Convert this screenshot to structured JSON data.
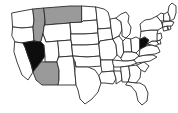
{
  "figure": {
    "kind": "choropleth-map",
    "region": "United States",
    "background_color": "#ffffff",
    "border_color": "#2b2b2b",
    "width": 178,
    "height": 113
  },
  "legend_colors": {
    "highlight_dark": "#0d0d0d",
    "highlight_mid": "#9a9a9a",
    "unhighlighted": "#ffffff"
  },
  "states": [
    {
      "id": "WA",
      "name": "Washington",
      "fill": "none"
    },
    {
      "id": "OR",
      "name": "Oregon",
      "fill": "none"
    },
    {
      "id": "CA",
      "name": "California",
      "fill": "none"
    },
    {
      "id": "ID",
      "name": "Idaho",
      "fill": "gray"
    },
    {
      "id": "NV",
      "name": "Nevada",
      "fill": "black"
    },
    {
      "id": "MT",
      "name": "Montana",
      "fill": "gray"
    },
    {
      "id": "WY",
      "name": "Wyoming",
      "fill": "none"
    },
    {
      "id": "UT",
      "name": "Utah",
      "fill": "none"
    },
    {
      "id": "AZ",
      "name": "Arizona",
      "fill": "gray"
    },
    {
      "id": "CO",
      "name": "Colorado",
      "fill": "none"
    },
    {
      "id": "NM",
      "name": "New Mexico",
      "fill": "none"
    },
    {
      "id": "ND",
      "name": "North Dakota",
      "fill": "none"
    },
    {
      "id": "SD",
      "name": "South Dakota",
      "fill": "none"
    },
    {
      "id": "NE",
      "name": "Nebraska",
      "fill": "none"
    },
    {
      "id": "KS",
      "name": "Kansas",
      "fill": "none"
    },
    {
      "id": "OK",
      "name": "Oklahoma",
      "fill": "none"
    },
    {
      "id": "TX",
      "name": "Texas",
      "fill": "none"
    },
    {
      "id": "MN",
      "name": "Minnesota",
      "fill": "none"
    },
    {
      "id": "IA",
      "name": "Iowa",
      "fill": "none"
    },
    {
      "id": "MO",
      "name": "Missouri",
      "fill": "none"
    },
    {
      "id": "AR",
      "name": "Arkansas",
      "fill": "none"
    },
    {
      "id": "LA",
      "name": "Louisiana",
      "fill": "none"
    },
    {
      "id": "WI",
      "name": "Wisconsin",
      "fill": "none"
    },
    {
      "id": "IL",
      "name": "Illinois",
      "fill": "none"
    },
    {
      "id": "MS",
      "name": "Mississippi",
      "fill": "none"
    },
    {
      "id": "MI",
      "name": "Michigan",
      "fill": "none"
    },
    {
      "id": "IN",
      "name": "Indiana",
      "fill": "none"
    },
    {
      "id": "OH",
      "name": "Ohio",
      "fill": "none"
    },
    {
      "id": "KY",
      "name": "Kentucky",
      "fill": "none"
    },
    {
      "id": "TN",
      "name": "Tennessee",
      "fill": "none"
    },
    {
      "id": "AL",
      "name": "Alabama",
      "fill": "none"
    },
    {
      "id": "GA",
      "name": "Georgia",
      "fill": "none"
    },
    {
      "id": "FL",
      "name": "Florida",
      "fill": "none"
    },
    {
      "id": "SC",
      "name": "South Carolina",
      "fill": "none"
    },
    {
      "id": "NC",
      "name": "North Carolina",
      "fill": "none"
    },
    {
      "id": "VA",
      "name": "Virginia",
      "fill": "none"
    },
    {
      "id": "WV",
      "name": "West Virginia",
      "fill": "black"
    },
    {
      "id": "MD",
      "name": "Maryland",
      "fill": "none"
    },
    {
      "id": "DE",
      "name": "Delaware",
      "fill": "none"
    },
    {
      "id": "NJ",
      "name": "New Jersey",
      "fill": "none"
    },
    {
      "id": "PA",
      "name": "Pennsylvania",
      "fill": "none"
    },
    {
      "id": "NY",
      "name": "New York",
      "fill": "none"
    },
    {
      "id": "CT",
      "name": "Connecticut",
      "fill": "none"
    },
    {
      "id": "RI",
      "name": "Rhode Island",
      "fill": "none"
    },
    {
      "id": "MA",
      "name": "Massachusetts",
      "fill": "none"
    },
    {
      "id": "VT",
      "name": "Vermont",
      "fill": "none"
    },
    {
      "id": "NH",
      "name": "New Hampshire",
      "fill": "none"
    },
    {
      "id": "ME",
      "name": "Maine",
      "fill": "none"
    }
  ],
  "highlighted": {
    "black": [
      "Nevada",
      "West Virginia"
    ],
    "gray": [
      "Montana",
      "Idaho",
      "Arizona"
    ]
  }
}
